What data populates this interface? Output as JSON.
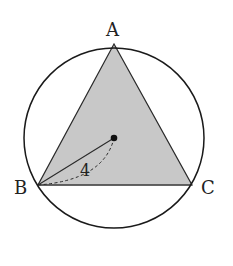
{
  "diagram": {
    "type": "geometry",
    "labels": {
      "vertex_a": "A",
      "vertex_b": "B",
      "vertex_c": "C",
      "radius_length": "4"
    },
    "colors": {
      "triangle_fill": "#c8c8c8",
      "stroke": "#1a1a1a",
      "background": "#ffffff"
    }
  }
}
